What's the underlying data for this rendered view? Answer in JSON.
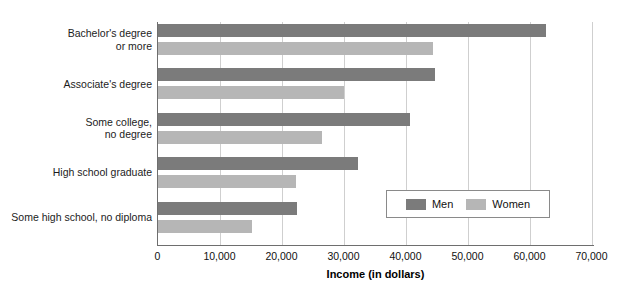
{
  "chart_data": {
    "type": "bar",
    "orientation": "horizontal",
    "title": "",
    "xlabel": "Income (in dollars)",
    "ylabel": "",
    "xlim": [
      0,
      70000
    ],
    "xticks": [
      0,
      10000,
      20000,
      30000,
      40000,
      50000,
      60000,
      70000
    ],
    "xticklabels": [
      "0",
      "10,000",
      "20,000",
      "30,000",
      "40,000",
      "50,000",
      "60,000",
      "70,000"
    ],
    "grid": "vertical",
    "legend_position": "inside-right",
    "categories": [
      "Bachelor's degree\nor more",
      "Associate's degree",
      "Some college,\nno degree",
      "High school graduate",
      "Some high school, no diploma"
    ],
    "series": [
      {
        "name": "Men",
        "color": "#7b7b7b",
        "values": [
          62700,
          44800,
          40700,
          32400,
          22500
        ]
      },
      {
        "name": "Women",
        "color": "#b6b6b6",
        "values": [
          44400,
          30000,
          26500,
          22300,
          15300
        ]
      }
    ]
  },
  "legend": {
    "items": [
      {
        "label": "Men"
      },
      {
        "label": "Women"
      }
    ]
  },
  "title_strip": {
    "text": ""
  }
}
